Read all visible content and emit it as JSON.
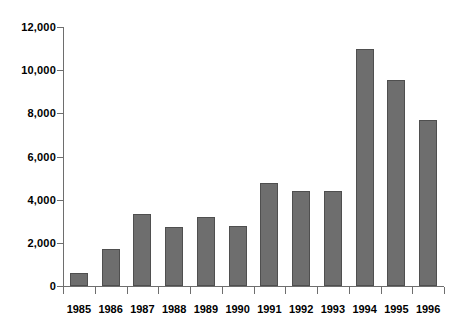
{
  "chart_data": {
    "type": "bar",
    "title": "",
    "subtitle": "",
    "xlabel": "",
    "ylabel": "",
    "categories": [
      "1985",
      "1986",
      "1987",
      "1988",
      "1989",
      "1990",
      "1991",
      "1992",
      "1993",
      "1994",
      "1995",
      "1996"
    ],
    "values": [
      600,
      1700,
      3350,
      2750,
      3200,
      2800,
      4750,
      4400,
      4400,
      11000,
      9550,
      7700
    ],
    "ylim": [
      0,
      12000
    ],
    "ytick_values": [
      0,
      2000,
      4000,
      6000,
      8000,
      10000,
      12000
    ],
    "ytick_labels": [
      "0",
      "2,000",
      "4,000",
      "6,000",
      "8,000",
      "10,000",
      "12,000"
    ],
    "grid": false,
    "legend": null,
    "legend_position": "none",
    "bar_color": "#6e6e6e",
    "bar_border_color": "#4f4f4f",
    "axis_color": "#6e6e6e",
    "background_color": "#ffffff",
    "text_color": "#000000",
    "annotations": []
  }
}
